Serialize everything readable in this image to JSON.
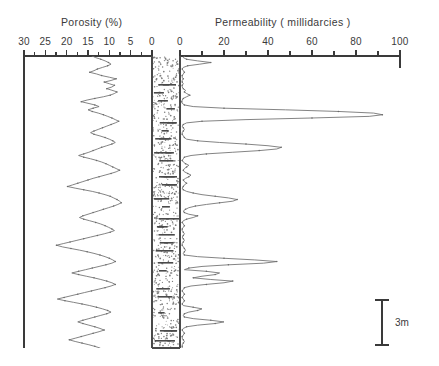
{
  "figure": {
    "name": "porosity-permeability-well-log",
    "background": "#ffffff",
    "ink_color": "#3a3a3a",
    "curve_color": "#6e6e6e"
  },
  "scalebar": {
    "label": "3m",
    "name": "vertical-scale-bar"
  },
  "chart_data": {
    "type": "line",
    "title": "",
    "orientation": "vertical-depth-log",
    "panels": [
      {
        "id": "porosity",
        "title": "Porosity (%)",
        "xlabel": "Porosity (%)",
        "ylabel": "",
        "units": "%",
        "xlim": [
          30,
          0
        ],
        "axis_direction": "reversed-right-to-left",
        "tick_labels": [
          "30",
          "25",
          "20",
          "15",
          "10",
          "5",
          "0"
        ],
        "tick_values": [
          30,
          25,
          20,
          15,
          10,
          5,
          0
        ],
        "minor_tick_step": 2.5,
        "grid": false,
        "legend": null,
        "series": [
          {
            "name": "Porosity",
            "x": [
              14.0,
              13.2,
              12.0,
              11.0,
              10.2,
              9.6,
              10.4,
              11.6,
              12.8,
              13.6,
              14.6,
              13.0,
              11.8,
              10.0,
              8.4,
              9.6,
              11.2,
              10.0,
              8.8,
              9.4,
              10.6,
              9.4,
              8.2,
              8.8,
              9.8,
              11.4,
              13.4,
              15.2,
              16.6,
              15.0,
              13.4,
              12.4,
              13.8,
              15.0,
              14.0,
              12.6,
              11.4,
              10.4,
              9.4,
              8.6,
              7.8,
              8.6,
              9.6,
              10.6,
              11.6,
              12.6,
              13.6,
              14.4,
              13.6,
              12.2,
              11.0,
              10.0,
              9.2,
              8.6,
              9.4,
              10.6,
              11.8,
              12.8,
              13.8,
              14.8,
              16.0,
              17.2,
              16.0,
              14.4,
              13.0,
              11.8,
              10.8,
              10.0,
              9.2,
              8.4,
              7.6,
              8.4,
              9.6,
              11.0,
              12.4,
              13.8,
              15.0,
              16.2,
              17.4,
              18.6,
              19.8,
              18.0,
              16.0,
              14.0,
              12.4,
              11.0,
              9.8,
              9.0,
              8.2,
              7.6,
              7.2,
              8.0,
              9.0,
              10.2,
              11.4,
              12.6,
              13.8,
              15.0,
              16.2,
              17.0,
              16.0,
              14.6,
              13.2,
              12.0,
              11.0,
              10.2,
              9.4,
              8.8,
              9.8,
              11.2,
              12.8,
              14.4,
              16.0,
              17.6,
              19.2,
              20.8,
              22.4,
              21.0,
              19.0,
              17.0,
              15.2,
              13.6,
              12.2,
              11.0,
              10.0,
              9.2,
              8.6,
              9.4,
              10.8,
              12.4,
              14.0,
              15.6,
              17.2,
              18.8,
              17.2,
              15.4,
              13.6,
              12.0,
              10.6,
              9.4,
              8.6,
              9.6,
              11.0,
              12.6,
              14.2,
              15.8,
              17.4,
              19.0,
              20.6,
              22.2,
              20.4,
              18.4,
              16.4,
              14.6,
              13.0,
              11.6,
              10.4,
              9.6,
              10.6,
              12.0,
              13.4,
              14.8,
              16.2,
              17.4,
              16.2,
              14.8,
              13.4,
              12.2,
              11.2,
              12.4,
              13.8,
              15.2,
              16.6,
              18.0,
              19.4,
              18.0,
              16.4,
              14.8,
              13.4,
              12.2
            ],
            "y_depth_index": "evenly sampled from top (0) to bottom (1) of log interval"
          }
        ]
      },
      {
        "id": "permeability",
        "title": "Permeability ( millidarcies )",
        "xlabel": "Permeability ( millidarcies )",
        "ylabel": "",
        "units": "millidarcies",
        "xlim": [
          0,
          100
        ],
        "axis_direction": "left-to-right",
        "tick_labels": [
          "0",
          "20",
          "40",
          "60",
          "80",
          "100"
        ],
        "tick_values": [
          0,
          20,
          40,
          60,
          80,
          100
        ],
        "minor_tick_step": 10,
        "grid": false,
        "legend": null,
        "series": [
          {
            "name": "Permeability",
            "x": [
              2.0,
              1.5,
              3.0,
              8.0,
              14.0,
              9.0,
              3.5,
              1.5,
              1.0,
              1.5,
              2.0,
              1.5,
              1.0,
              1.0,
              1.5,
              1.0,
              1.0,
              1.5,
              1.0,
              1.0,
              1.5,
              2.5,
              2.0,
              3.0,
              4.5,
              3.0,
              1.5,
              1.0,
              0.8,
              1.0,
              2.0,
              6.0,
              20.0,
              48.0,
              72.0,
              88.0,
              92.0,
              86.0,
              60.0,
              30.0,
              10.0,
              3.0,
              1.5,
              1.0,
              1.5,
              2.0,
              1.5,
              1.0,
              1.0,
              1.5,
              2.0,
              3.0,
              8.0,
              18.0,
              30.0,
              40.0,
              46.0,
              44.0,
              36.0,
              24.0,
              12.0,
              5.0,
              2.0,
              1.5,
              1.0,
              1.5,
              2.5,
              4.0,
              3.0,
              2.0,
              1.5,
              2.0,
              3.5,
              5.0,
              4.0,
              2.5,
              1.5,
              2.0,
              3.0,
              2.0,
              1.5,
              1.0,
              1.5,
              3.0,
              6.0,
              10.0,
              16.0,
              22.0,
              26.0,
              24.0,
              18.0,
              12.0,
              7.0,
              4.0,
              2.5,
              1.5,
              2.0,
              4.0,
              8.0,
              6.0,
              3.0,
              1.5,
              1.0,
              1.5,
              2.0,
              1.5,
              1.0,
              1.0,
              1.5,
              2.0,
              1.5,
              1.0,
              1.5,
              2.0,
              1.5,
              1.0,
              1.0,
              1.5,
              2.0,
              2.5,
              2.0,
              1.5,
              2.0,
              8.0,
              20.0,
              34.0,
              44.0,
              38.0,
              22.0,
              10.0,
              4.0,
              2.0,
              12.0,
              18.0,
              16.0,
              10.0,
              6.0,
              14.0,
              24.0,
              20.0,
              12.0,
              5.0,
              2.0,
              1.5,
              1.0,
              1.5,
              2.0,
              1.5,
              1.0,
              1.5,
              2.0,
              1.5,
              1.0,
              1.5,
              6.0,
              10.0,
              8.0,
              4.0,
              2.0,
              1.5,
              2.0,
              6.0,
              14.0,
              20.0,
              16.0,
              8.0,
              3.0,
              1.5,
              1.0,
              1.5,
              2.0,
              1.5,
              1.0,
              1.0,
              1.5,
              2.0,
              1.5,
              1.0,
              1.0,
              1.0
            ],
            "y_depth_index": "evenly sampled from top (0) to bottom (1) of log interval"
          }
        ]
      }
    ],
    "lithology": {
      "name": "lithology-column",
      "pattern": "stippled sandstone with thin dark shale/cemented streaks",
      "label": ""
    }
  }
}
